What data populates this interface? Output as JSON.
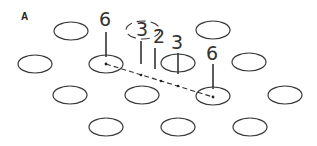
{
  "panel_label": "A",
  "lattice": {
    "stroke_color": "#3a3a3a",
    "rows": [
      {
        "y": 31,
        "cx": [
          71,
          213
        ]
      },
      {
        "y": 64,
        "cx": [
          35,
          106,
          178,
          249
        ]
      },
      {
        "y": 95,
        "cx": [
          70,
          142,
          213,
          285
        ]
      },
      {
        "y": 127,
        "cx": [
          106,
          178,
          250
        ]
      }
    ],
    "rx": 17,
    "ry": 9
  },
  "labels": {
    "left_six": "6",
    "bracket_three": "3",
    "two": "2",
    "three": "3",
    "right_six": "6"
  },
  "path": {
    "from": [
      106,
      64
    ],
    "to": [
      213,
      97
    ],
    "intermediate_points": [
      [
        141,
        75
      ],
      [
        161,
        81
      ],
      [
        178,
        86
      ]
    ],
    "style": "dashed"
  }
}
